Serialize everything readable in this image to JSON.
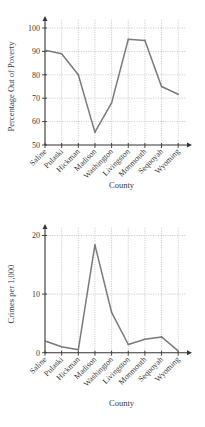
{
  "chart_data": [
    {
      "type": "line",
      "title": "",
      "xlabel": "County",
      "ylabel": "Percentage Out of Poverty",
      "categories": [
        "Saline",
        "Pulaski",
        "Hickman",
        "Madison",
        "Washington",
        "Livingston",
        "Monmouth",
        "Sequoyah",
        "Wyoming"
      ],
      "series": [
        {
          "name": "Percentage Out of Poverty",
          "values": [
            90.5,
            89,
            80,
            55.5,
            68,
            95.2,
            94.7,
            75,
            71.7
          ]
        }
      ],
      "yticks": [
        50,
        60,
        70,
        80,
        90,
        100
      ],
      "ylim": [
        50,
        105
      ],
      "grid": true,
      "legend": "none",
      "colors": {
        "line": "#7a7a7a",
        "axis": "#333333",
        "grid": "#b8b8b8"
      }
    },
    {
      "type": "line",
      "title": "",
      "xlabel": "County",
      "ylabel": "Crimes per 1,000",
      "categories": [
        "Saline",
        "Pulaski",
        "Hickman",
        "Madison",
        "Washington",
        "Livingston",
        "Monmouth",
        "Sequoyah",
        "Wyoming"
      ],
      "series": [
        {
          "name": "Crimes per 1,000",
          "values": [
            2.0,
            1.0,
            0.5,
            18.4,
            6.9,
            1.4,
            2.3,
            2.7,
            0.3
          ]
        }
      ],
      "yticks": [
        0,
        10,
        20
      ],
      "ylim": [
        0,
        22
      ],
      "grid": true,
      "legend": "none",
      "colors": {
        "line": "#7a7a7a",
        "axis": "#333333",
        "grid": "#b8b8b8"
      }
    }
  ]
}
